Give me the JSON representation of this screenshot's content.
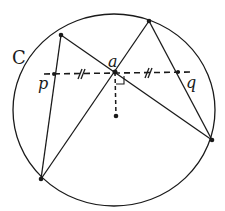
{
  "diagram": {
    "labels": {
      "circle": "C",
      "midpoint": "a",
      "left": "p",
      "right": "q"
    },
    "colors": {
      "stroke": "#1a1a1a",
      "background": "#ffffff"
    },
    "circle": {
      "cx": 114,
      "cy": 110,
      "rx": 101,
      "ry": 96
    },
    "points": {
      "top_left": [
        61,
        35
      ],
      "top_right": [
        149,
        21
      ],
      "a": [
        115,
        72
      ],
      "p": [
        54,
        74
      ],
      "q": [
        178,
        72
      ],
      "right": [
        212,
        140
      ],
      "bottom_left": [
        41,
        179
      ],
      "center": [
        116,
        116
      ]
    },
    "chords": [
      [
        "top_left",
        "right"
      ],
      [
        "top_right",
        "bottom_left"
      ],
      [
        "top_left",
        "bottom_left"
      ],
      [
        "top_right",
        "right"
      ]
    ],
    "dashed": [
      [
        "p_ext",
        "q_ext"
      ],
      [
        "a",
        "center"
      ]
    ],
    "annotations": [
      "equal-tick pa",
      "equal-tick aq",
      "right-angle at a"
    ]
  }
}
